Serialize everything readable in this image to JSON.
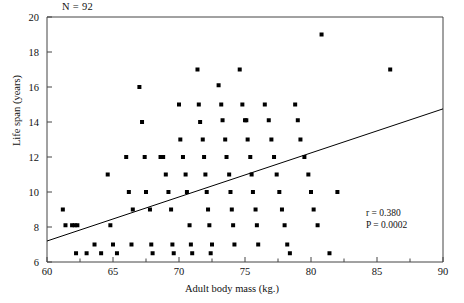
{
  "figure": {
    "sample_size_label": "N = 92",
    "cropped_caption_fragment": "",
    "stats": {
      "r_label": "r = 0.380",
      "p_label": "P = 0.0002"
    }
  },
  "chart_data": {
    "type": "scatter",
    "title": "",
    "xlabel": "Adult body mass (kg.)",
    "ylabel": "Life span (years)",
    "xlim": [
      60,
      90
    ],
    "ylim": [
      6,
      20
    ],
    "xticks": [
      60,
      65,
      70,
      75,
      80,
      85,
      90
    ],
    "xticklabels": [
      "60",
      "65",
      "70",
      "75",
      "80",
      "85",
      "90"
    ],
    "yticks": [
      6,
      8,
      10,
      12,
      14,
      16,
      18,
      20
    ],
    "yticklabels": [
      "6",
      "8",
      "10",
      "12",
      "14",
      "16",
      "18",
      "20"
    ],
    "minor_xticks": [
      62.5,
      67.5,
      72.5,
      77.5,
      82.5,
      87.5
    ],
    "grid": false,
    "legend": null,
    "n": 92,
    "r": 0.38,
    "p": 0.0002,
    "marker": "square",
    "marker_color": "#000000",
    "marker_size_px": 4,
    "regression_line": {
      "x": [
        60,
        90
      ],
      "y": [
        7.2,
        14.75
      ],
      "color": "#000000",
      "width": 1
    },
    "points": [
      [
        61.2,
        9.0
      ],
      [
        61.4,
        8.1
      ],
      [
        61.9,
        8.1
      ],
      [
        62.1,
        8.1
      ],
      [
        62.3,
        8.1
      ],
      [
        62.2,
        6.5
      ],
      [
        63.0,
        6.5
      ],
      [
        63.6,
        7.0
      ],
      [
        64.1,
        6.5
      ],
      [
        64.6,
        11.0
      ],
      [
        64.8,
        8.1
      ],
      [
        65.0,
        7.0
      ],
      [
        65.3,
        6.5
      ],
      [
        66.0,
        12.0
      ],
      [
        66.2,
        10.0
      ],
      [
        66.5,
        9.0
      ],
      [
        66.4,
        7.0
      ],
      [
        67.0,
        16.0
      ],
      [
        67.2,
        14.0
      ],
      [
        67.4,
        12.0
      ],
      [
        67.5,
        10.0
      ],
      [
        67.8,
        9.0
      ],
      [
        67.9,
        7.0
      ],
      [
        68.0,
        6.5
      ],
      [
        68.6,
        12.0
      ],
      [
        68.8,
        12.0
      ],
      [
        69.0,
        11.0
      ],
      [
        69.2,
        10.0
      ],
      [
        69.4,
        9.0
      ],
      [
        69.5,
        7.0
      ],
      [
        69.6,
        6.5
      ],
      [
        70.0,
        15.0
      ],
      [
        70.1,
        13.0
      ],
      [
        70.3,
        12.0
      ],
      [
        70.5,
        11.0
      ],
      [
        70.6,
        10.0
      ],
      [
        70.8,
        8.1
      ],
      [
        70.9,
        7.0
      ],
      [
        71.0,
        6.5
      ],
      [
        71.4,
        17.0
      ],
      [
        71.5,
        15.0
      ],
      [
        71.6,
        14.0
      ],
      [
        71.8,
        13.0
      ],
      [
        71.9,
        12.0
      ],
      [
        72.0,
        11.0
      ],
      [
        72.1,
        10.0
      ],
      [
        72.2,
        9.0
      ],
      [
        72.3,
        8.1
      ],
      [
        72.5,
        7.0
      ],
      [
        72.4,
        6.5
      ],
      [
        73.0,
        16.1
      ],
      [
        73.2,
        15.0
      ],
      [
        73.3,
        14.1
      ],
      [
        73.5,
        13.0
      ],
      [
        73.6,
        12.0
      ],
      [
        73.8,
        11.0
      ],
      [
        73.9,
        10.0
      ],
      [
        74.0,
        9.0
      ],
      [
        74.1,
        8.1
      ],
      [
        74.2,
        7.0
      ],
      [
        74.6,
        17.0
      ],
      [
        74.8,
        15.0
      ],
      [
        75.0,
        14.1
      ],
      [
        75.1,
        14.1
      ],
      [
        75.2,
        13.0
      ],
      [
        75.4,
        12.0
      ],
      [
        75.5,
        11.0
      ],
      [
        75.6,
        10.0
      ],
      [
        75.8,
        9.0
      ],
      [
        75.9,
        8.1
      ],
      [
        76.0,
        7.0
      ],
      [
        76.5,
        15.0
      ],
      [
        76.8,
        14.1
      ],
      [
        77.0,
        13.0
      ],
      [
        77.2,
        12.0
      ],
      [
        77.4,
        11.0
      ],
      [
        77.6,
        10.0
      ],
      [
        77.8,
        9.0
      ],
      [
        78.0,
        8.1
      ],
      [
        78.2,
        7.0
      ],
      [
        78.4,
        6.5
      ],
      [
        78.8,
        15.0
      ],
      [
        79.0,
        14.1
      ],
      [
        79.2,
        13.0
      ],
      [
        79.5,
        12.0
      ],
      [
        79.8,
        11.0
      ],
      [
        80.0,
        10.0
      ],
      [
        80.2,
        9.0
      ],
      [
        80.5,
        8.1
      ],
      [
        80.8,
        19.0
      ],
      [
        81.4,
        6.5
      ],
      [
        86.0,
        17.0
      ],
      [
        82.0,
        10.0
      ]
    ]
  }
}
